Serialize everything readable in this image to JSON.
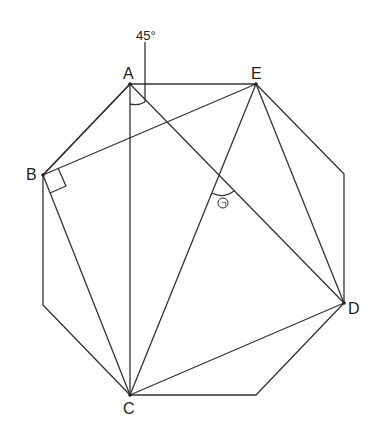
{
  "diagram": {
    "type": "geometry-octagon",
    "stroke_color": "#333333",
    "labels": {
      "A": "A",
      "B": "B",
      "C": "C",
      "D": "D",
      "E": "E",
      "angle_given": "45°",
      "angle_unknown": "㉠"
    },
    "points": {
      "A": [
        130,
        84
      ],
      "E": [
        256,
        84
      ],
      "R1": [
        344,
        174
      ],
      "D": [
        344,
        303
      ],
      "R2": [
        256,
        395
      ],
      "C": [
        130,
        395
      ],
      "L2": [
        43,
        305
      ],
      "B": [
        43,
        175
      ]
    }
  }
}
